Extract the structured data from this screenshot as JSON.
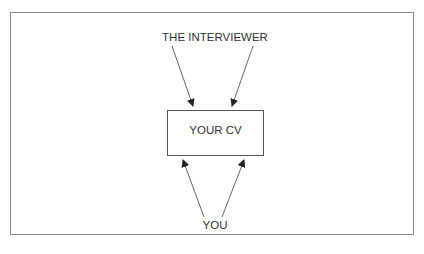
{
  "diagram": {
    "top_node": "THE INTERVIEWER",
    "center_node": "YOUR CV",
    "bottom_node": "YOU",
    "edges": [
      {
        "from": "THE INTERVIEWER",
        "to": "YOUR CV",
        "count": 2
      },
      {
        "from": "YOU",
        "to": "YOUR CV",
        "count": 2
      }
    ],
    "colors": {
      "line": "#555555",
      "frame": "#8a8a8a",
      "text": "#333333"
    }
  }
}
